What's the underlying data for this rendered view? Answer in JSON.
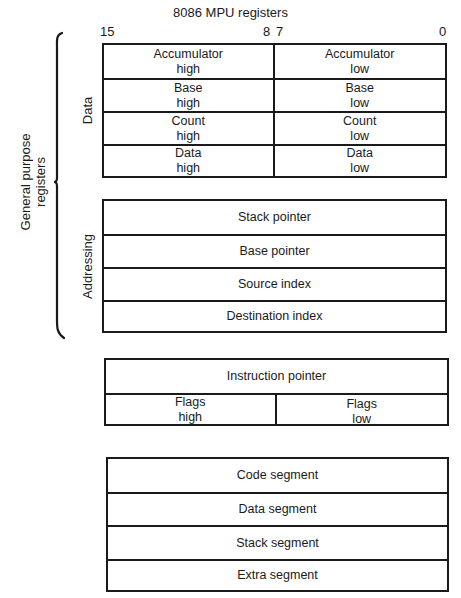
{
  "title": "8086 MPU registers",
  "bit_labels": {
    "msb": "15",
    "mid_high": "8",
    "mid_low": "7",
    "lsb": "0"
  },
  "group_labels": {
    "general_purpose": [
      "General purpose",
      "registers"
    ],
    "data": "Data",
    "addressing": "Addressing"
  },
  "data_registers": [
    {
      "high": [
        "Accumulator",
        "high"
      ],
      "low": [
        "Accumulator",
        "low"
      ]
    },
    {
      "high": [
        "Base",
        "high"
      ],
      "low": [
        "Base",
        "low"
      ]
    },
    {
      "high": [
        "Count",
        "high"
      ],
      "low": [
        "Count",
        "low"
      ]
    },
    {
      "high": [
        "Data",
        "high"
      ],
      "low": [
        "Data",
        "low"
      ]
    }
  ],
  "addressing_registers": [
    "Stack pointer",
    "Base pointer",
    "Source index",
    "Destination index"
  ],
  "control_registers": {
    "instruction_pointer": "Instruction pointer",
    "flags": {
      "high": [
        "Flags",
        "high"
      ],
      "low": [
        "Flags",
        "low"
      ]
    }
  },
  "segment_registers": [
    "Code segment",
    "Data segment",
    "Stack segment",
    "Extra segment"
  ],
  "colors": {
    "ink": "#1a1a1a",
    "background": "#ffffff"
  }
}
